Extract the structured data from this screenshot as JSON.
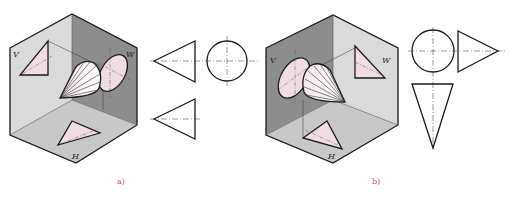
{
  "figure": {
    "colors": {
      "plane_light": "#dcdcdc",
      "plane_mid": "#c4c4c4",
      "plane_dark": "#8f8f8f",
      "projection_fill": "#f2dce4",
      "outline": "#1a1a1a"
    }
  },
  "panel_a": {
    "caption": "a)",
    "plane_labels": {
      "v": "V",
      "w": "W",
      "h": "H"
    },
    "views": [
      "front-view-triangle",
      "side-view-circle",
      "top-view-triangle"
    ]
  },
  "panel_b": {
    "caption": "b)",
    "plane_labels": {
      "v": "V",
      "w": "W",
      "h": "H"
    },
    "views": [
      "front-view-circle",
      "side-view-triangle",
      "top-view-triangle"
    ]
  }
}
